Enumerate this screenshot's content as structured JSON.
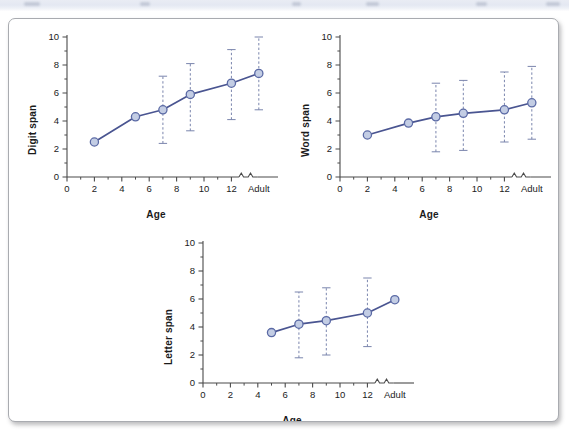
{
  "figure": {
    "background_color": "#ffffff",
    "border_color": "#a9abb0",
    "series_line_color": "#4a5591",
    "marker_fill_color": "#c3cde4",
    "marker_edge_color": "#5b6aa5",
    "errorbar_color": "#7a85ad",
    "axis_color": "#4a4a4a",
    "text_color": "#1b1b1b"
  },
  "chart_data": [
    {
      "id": "digit-span",
      "type": "line",
      "title": "",
      "xlabel": "Age",
      "ylabel": "Digit span",
      "xlim": [
        0,
        15.4
      ],
      "ylim": [
        0,
        10
      ],
      "grid": false,
      "legend": null,
      "axis_break": true,
      "axis_break_label": "Adult",
      "xticks": [
        0,
        2,
        4,
        6,
        8,
        10,
        12,
        14
      ],
      "xticklabels": [
        "0",
        "2",
        "4",
        "6",
        "8",
        "10",
        "12",
        "Adult"
      ],
      "yticks": [
        0,
        2,
        4,
        6,
        8,
        10
      ],
      "yticklabels": [
        "0",
        "2",
        "4",
        "6",
        "8",
        "10"
      ],
      "y_minor_ticks": true,
      "x": [
        2,
        5,
        7,
        9,
        12,
        14
      ],
      "xlabels": [
        "2",
        "5",
        "7",
        "9",
        "12",
        "Adult"
      ],
      "values": [
        2.5,
        4.3,
        4.8,
        5.9,
        6.7,
        7.4
      ],
      "error_low": [
        null,
        null,
        2.4,
        3.3,
        4.1,
        4.8
      ],
      "error_high": [
        null,
        null,
        7.2,
        8.1,
        9.1,
        10.0
      ]
    },
    {
      "id": "word-span",
      "type": "line",
      "title": "",
      "xlabel": "Age",
      "ylabel": "Word span",
      "xlim": [
        0,
        15.4
      ],
      "ylim": [
        0,
        10
      ],
      "grid": false,
      "legend": null,
      "axis_break": true,
      "axis_break_label": "Adult",
      "xticks": [
        0,
        2,
        4,
        6,
        8,
        10,
        12,
        14
      ],
      "xticklabels": [
        "0",
        "2",
        "4",
        "6",
        "8",
        "10",
        "12",
        "Adult"
      ],
      "yticks": [
        0,
        2,
        4,
        6,
        8,
        10
      ],
      "yticklabels": [
        "0",
        "2",
        "4",
        "6",
        "8",
        "10"
      ],
      "y_minor_ticks": true,
      "x": [
        2,
        5,
        7,
        9,
        12,
        14
      ],
      "xlabels": [
        "2",
        "5",
        "7",
        "9",
        "12",
        "Adult"
      ],
      "values": [
        3.0,
        3.85,
        4.3,
        4.55,
        4.8,
        5.3
      ],
      "error_low": [
        null,
        null,
        1.8,
        1.9,
        2.5,
        2.7
      ],
      "error_high": [
        null,
        null,
        6.7,
        6.9,
        7.5,
        7.9
      ]
    },
    {
      "id": "letter-span",
      "type": "line",
      "title": "",
      "xlabel": "Age",
      "ylabel": "Letter span",
      "xlim": [
        0,
        15.4
      ],
      "ylim": [
        0,
        10
      ],
      "grid": false,
      "legend": null,
      "axis_break": true,
      "axis_break_label": "Adult",
      "xticks": [
        0,
        2,
        4,
        6,
        8,
        10,
        12,
        14
      ],
      "xticklabels": [
        "0",
        "2",
        "4",
        "6",
        "8",
        "10",
        "12",
        "Adult"
      ],
      "yticks": [
        0,
        2,
        4,
        6,
        8,
        10
      ],
      "yticklabels": [
        "0",
        "2",
        "4",
        "6",
        "8",
        "10"
      ],
      "y_minor_ticks": true,
      "x": [
        5,
        7,
        9,
        12,
        14
      ],
      "xlabels": [
        "5",
        "7",
        "9",
        "12",
        "Adult"
      ],
      "values": [
        3.6,
        4.2,
        4.45,
        5.0,
        5.95
      ],
      "error_low": [
        null,
        1.8,
        2.0,
        2.6,
        null
      ],
      "error_high": [
        null,
        6.5,
        6.8,
        7.5,
        null
      ]
    }
  ]
}
